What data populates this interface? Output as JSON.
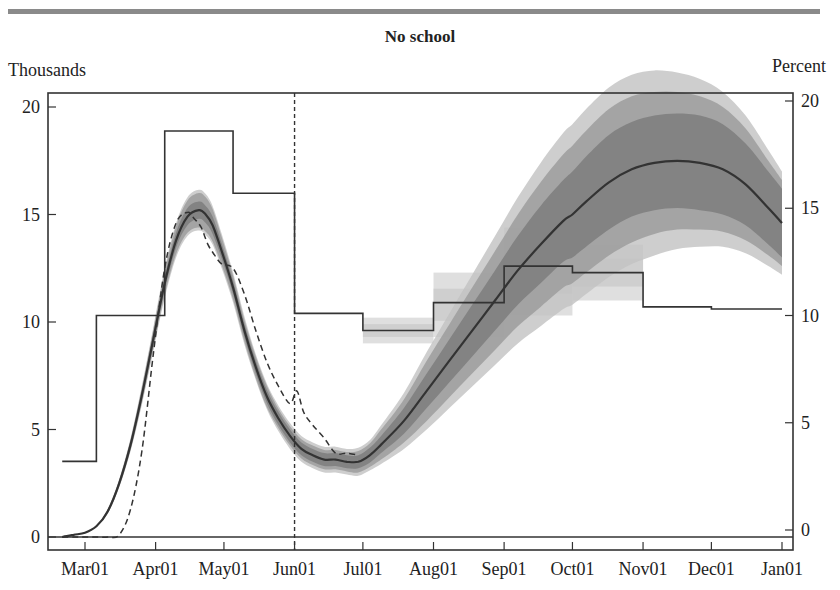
{
  "figure": {
    "header_rule_color": "#8a8a8a",
    "title": "No school",
    "left_unit": "Thousands",
    "right_unit": "Percent"
  },
  "chart_data": {
    "type": "line",
    "title": "No school",
    "ylabel": "Thousands",
    "y2label": "Percent",
    "ylim": [
      0,
      20
    ],
    "y2lim": [
      0,
      20
    ],
    "yticks": [
      0,
      5,
      10,
      15,
      20
    ],
    "y2ticks": [
      0,
      5,
      10,
      15,
      20
    ],
    "xtick_labels": [
      "Mar01",
      "Apr01",
      "May01",
      "Jun01",
      "Jul01",
      "Aug01",
      "Sep01",
      "Oct01",
      "Nov01",
      "Dec01",
      "Jan01"
    ],
    "xtick_days": [
      0,
      31,
      61,
      92,
      122,
      153,
      184,
      214,
      245,
      275,
      306
    ],
    "vertical_marker": {
      "label": "Jun01",
      "day": 92,
      "style": "dashed"
    },
    "grid": false,
    "series": [
      {
        "name": "Model (thousands, left axis)",
        "axis": "left",
        "style": "solid",
        "color": "#333333",
        "days": [
          -10,
          -5,
          0,
          5,
          10,
          15,
          20,
          25,
          30,
          35,
          40,
          45,
          50,
          53,
          56,
          60,
          65,
          70,
          75,
          80,
          85,
          90,
          95,
          100,
          105,
          110,
          115,
          120,
          125,
          130,
          140,
          150,
          160,
          170,
          180,
          190,
          200,
          210,
          214,
          220,
          230,
          240,
          250,
          260,
          270,
          280,
          290,
          300,
          306
        ],
        "values": [
          0,
          0.1,
          0.2,
          0.5,
          1.2,
          2.5,
          4.3,
          6.6,
          9.2,
          11.8,
          13.8,
          14.9,
          15.2,
          15.0,
          14.5,
          13.3,
          11.6,
          9.6,
          7.9,
          6.5,
          5.5,
          4.7,
          4.1,
          3.8,
          3.6,
          3.6,
          3.5,
          3.5,
          3.8,
          4.3,
          5.4,
          6.8,
          8.2,
          9.6,
          11.0,
          12.4,
          13.6,
          14.7,
          15.0,
          15.6,
          16.5,
          17.1,
          17.4,
          17.5,
          17.4,
          17.1,
          16.4,
          15.3,
          14.6
        ],
        "bands": [
          {
            "level": "inner",
            "color": "#7a7a7a",
            "halfwidth": [
              0,
              0,
              0,
              0,
              0.05,
              0.1,
              0.15,
              0.2,
              0.25,
              0.3,
              0.35,
              0.4,
              0.4,
              0.4,
              0.4,
              0.35,
              0.3,
              0.3,
              0.3,
              0.3,
              0.3,
              0.3,
              0.3,
              0.3,
              0.3,
              0.3,
              0.3,
              0.3,
              0.35,
              0.4,
              0.6,
              0.8,
              1.0,
              1.2,
              1.4,
              1.6,
              1.8,
              1.9,
              2.0,
              2.1,
              2.2,
              2.2,
              2.2,
              2.2,
              2.2,
              2.1,
              1.9,
              1.7,
              1.6
            ]
          },
          {
            "level": "middle",
            "color": "#9a9a9a",
            "halfwidth": [
              0,
              0,
              0,
              0,
              0.1,
              0.15,
              0.25,
              0.35,
              0.45,
              0.55,
              0.65,
              0.75,
              0.8,
              0.8,
              0.75,
              0.65,
              0.55,
              0.5,
              0.5,
              0.5,
              0.45,
              0.45,
              0.45,
              0.45,
              0.45,
              0.45,
              0.45,
              0.5,
              0.55,
              0.7,
              1.0,
              1.4,
              1.7,
              2.0,
              2.3,
              2.6,
              2.9,
              3.1,
              3.2,
              3.3,
              3.4,
              3.4,
              3.3,
              3.2,
              3.1,
              2.9,
              2.6,
              2.2,
              2.0
            ]
          },
          {
            "level": "outer",
            "color": "#c2c2c2",
            "halfwidth": [
              0,
              0,
              0,
              0,
              0.1,
              0.2,
              0.3,
              0.45,
              0.55,
              0.7,
              0.8,
              0.9,
              0.95,
              0.95,
              0.9,
              0.8,
              0.7,
              0.65,
              0.6,
              0.6,
              0.6,
              0.6,
              0.6,
              0.6,
              0.6,
              0.6,
              0.6,
              0.65,
              0.7,
              0.9,
              1.3,
              1.8,
              2.2,
              2.6,
              3.0,
              3.4,
              3.8,
              4.1,
              4.2,
              4.3,
              4.4,
              4.4,
              4.3,
              4.1,
              3.9,
              3.6,
              3.2,
              2.7,
              2.4
            ]
          }
        ]
      },
      {
        "name": "Data (thousands, left axis)",
        "axis": "left",
        "style": "dashed",
        "color": "#333333",
        "days": [
          -10,
          -5,
          0,
          5,
          10,
          15,
          20,
          25,
          30,
          35,
          40,
          45,
          48,
          51,
          54,
          57,
          60,
          65,
          70,
          75,
          80,
          85,
          90,
          93,
          96,
          100,
          105,
          110,
          115,
          120
        ],
        "values": [
          0,
          0,
          0,
          0,
          0,
          0.1,
          1.3,
          4.0,
          8.5,
          12.5,
          14.6,
          15.1,
          14.8,
          14.4,
          13.6,
          13.1,
          12.7,
          12.5,
          11.3,
          9.6,
          8.1,
          7.0,
          6.2,
          6.8,
          5.8,
          5.2,
          4.6,
          3.9,
          3.9,
          3.8
        ]
      },
      {
        "name": "Step rate (percent, right axis)",
        "axis": "right",
        "style": "step",
        "color": "#333333",
        "segments": [
          {
            "start": -10,
            "end": 5,
            "value": 3.2
          },
          {
            "start": 5,
            "end": 35,
            "value": 10.0
          },
          {
            "start": 35,
            "end": 65,
            "value": 18.6
          },
          {
            "start": 65,
            "end": 92,
            "value": 15.7
          },
          {
            "start": 92,
            "end": 122,
            "value": 10.1
          },
          {
            "start": 122,
            "end": 153,
            "value": 9.3
          },
          {
            "start": 153,
            "end": 184,
            "value": 10.6
          },
          {
            "start": 184,
            "end": 214,
            "value": 12.3
          },
          {
            "start": 214,
            "end": 245,
            "value": 12.0
          },
          {
            "start": 245,
            "end": 275,
            "value": 10.4
          },
          {
            "start": 275,
            "end": 306,
            "value": 10.3
          }
        ],
        "step_bands": [
          {
            "start": 122,
            "end": 153,
            "low": 8.7,
            "high": 9.9
          },
          {
            "start": 153,
            "end": 184,
            "low": 9.0,
            "high": 12.0
          },
          {
            "start": 184,
            "end": 214,
            "low": 10.0,
            "high": 14.1
          },
          {
            "start": 214,
            "end": 245,
            "low": 10.7,
            "high": 13.3
          }
        ]
      }
    ]
  }
}
